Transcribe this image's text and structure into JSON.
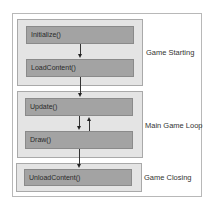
{
  "diagram": {
    "groups": [
      {
        "label": "Game Starting",
        "steps": [
          "Initialize()",
          "LoadContent()"
        ]
      },
      {
        "label": "Main Game Loop",
        "steps": [
          "Update()",
          "Draw()"
        ]
      },
      {
        "label": "Game Closing",
        "steps": [
          "UnloadContent()"
        ]
      }
    ],
    "colors": {
      "frame_border": "#b8b8b8",
      "group_fill": "#e4e4e4",
      "box_fill": "#a3a3a3",
      "arrow": "#222222"
    }
  }
}
